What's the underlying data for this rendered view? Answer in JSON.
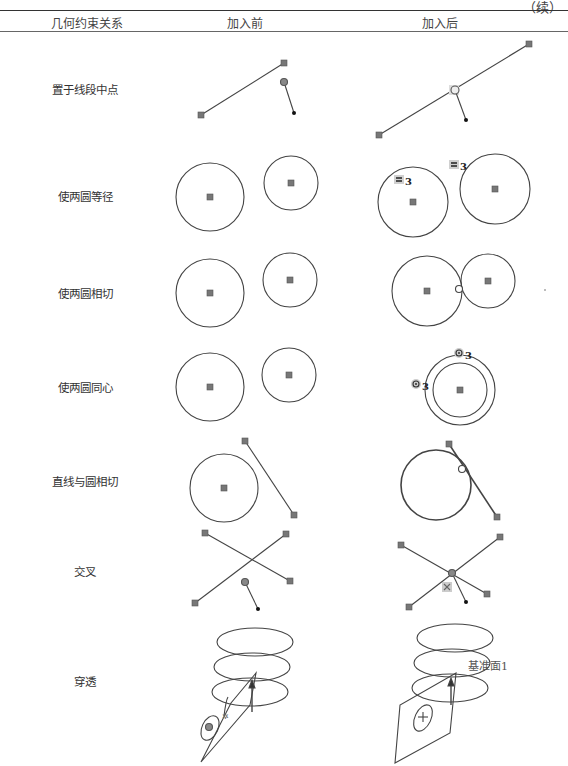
{
  "continued_marker": "（续）",
  "table": {
    "headers": [
      "几何约束关系",
      "加入前",
      "加入后"
    ],
    "rows": [
      {
        "label": "置于线段中点",
        "y": 89
      },
      {
        "label": "使两圆等径",
        "y": 196
      },
      {
        "label": "使两圆相切",
        "y": 293
      },
      {
        "label": "使两圆同心",
        "y": 387
      },
      {
        "label": "直线与圆相切",
        "y": 481
      },
      {
        "label": "交叉",
        "y": 571
      },
      {
        "label": "穿透",
        "y": 681
      }
    ]
  },
  "figures": {
    "equal_badge": "3",
    "concentric_badge": "3",
    "datum_plane_label": "基准面1"
  },
  "colors": {
    "line": "#444444",
    "handle": "#777777",
    "badge_bg": "#d0d0d0"
  }
}
